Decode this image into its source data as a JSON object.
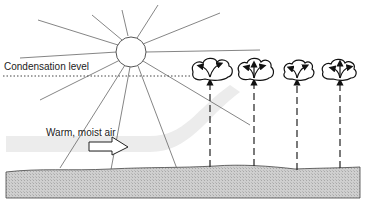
{
  "diagram": {
    "labels": {
      "condensation_level": "Condensation level",
      "warm_moist_air": "Warm, moist air"
    },
    "elements": {
      "sun": "sun-icon",
      "clouds": [
        {
          "name": "cloud-1",
          "cx": 227
        },
        {
          "name": "cloud-2",
          "cx": 263
        },
        {
          "name": "cloud-3",
          "cx": 297
        },
        {
          "name": "cloud-4",
          "cx": 339
        }
      ],
      "updraft_arrows": 4,
      "ground": "ground-surface",
      "airflow_arrow": "hollow-right-arrow"
    },
    "colors": {
      "ground_fill": "#c8c8c8",
      "air_band": "#ececec",
      "line": "#555555",
      "ink": "#111111"
    }
  }
}
